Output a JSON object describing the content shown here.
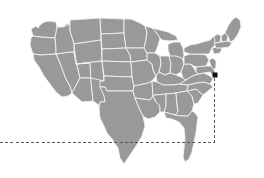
{
  "canvas": {
    "width": 264,
    "height": 178,
    "background_color": "#ffffff"
  },
  "map": {
    "title": "United States",
    "region": "contiguous-united-states",
    "land_fill_color": "#999999",
    "border_stroke_color": "#f2f2f2",
    "projection_hint": "albers-usa",
    "states_rendered": 48
  },
  "marker": {
    "name": "location-marker",
    "shape": "square",
    "color": "#111111",
    "size_px": 5,
    "x": 213,
    "y": 73,
    "region_label": "Mid-Atlantic coast"
  },
  "guides": {
    "color": "#5a5a5a",
    "dash_pattern": "3 2.2",
    "corner_x": 214,
    "corner_y": 142,
    "vertical": {
      "name": "vertical-guide",
      "x": 214,
      "y_start": 78,
      "y_end": 142
    },
    "horizontal": {
      "name": "horizontal-guide",
      "y": 142,
      "x_start": 0,
      "x_end": 214
    }
  }
}
